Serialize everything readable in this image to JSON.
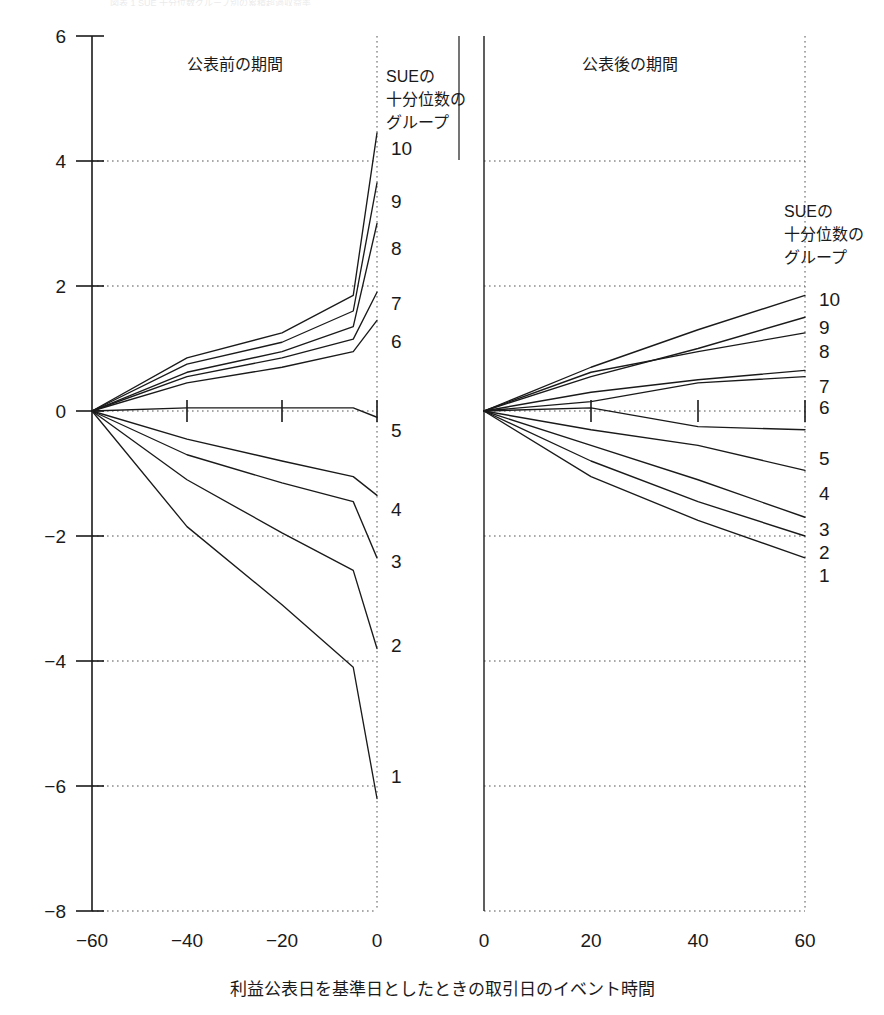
{
  "figure": {
    "faint_top_text": "図表 1 SUE 十分位数グループ別の累積超過収益率",
    "xlabel": "利益公表日を基準日としたときの取引日のイベント時間"
  },
  "panels": {
    "left": {
      "title": "公表前の期間",
      "legend_title_lines": [
        "SUEの",
        "十分位数の",
        "グループ"
      ],
      "x_ticks": [
        "-60",
        "-40",
        "-20",
        "0"
      ],
      "xlim": [
        -60,
        0
      ]
    },
    "right": {
      "title": "公表後の期間",
      "legend_title_lines": [
        "SUEの",
        "十分位数の",
        "グループ"
      ],
      "x_ticks": [
        "0",
        "20",
        "40",
        "60"
      ],
      "xlim": [
        0,
        60
      ]
    }
  },
  "axis": {
    "y_ticks": [
      "6",
      "4",
      "2",
      "0",
      "-2",
      "-4",
      "-6",
      "-8"
    ],
    "ylim": [
      -8,
      6
    ],
    "gridlines_on": true
  },
  "colors": {
    "line": "#1a1a1a",
    "grid": "#555555",
    "background": "#ffffff"
  },
  "chart_data": {
    "type": "line",
    "title": "",
    "subtitle": "",
    "xlabel": "利益公表日を基準日としたときの取引日のイベント時間",
    "ylabel": "",
    "ylim": [
      -8,
      6
    ],
    "grid": true,
    "legend_position": "right-of-each-panel",
    "legend_title": "SUEの十分位数のグループ",
    "panels": [
      {
        "name": "公表前の期間",
        "xlim": [
          -60,
          0
        ],
        "x": [
          -60,
          -40,
          -20,
          -5,
          0
        ],
        "series": [
          {
            "name": "10",
            "values": [
              0.0,
              0.85,
              1.25,
              1.85,
              4.45
            ]
          },
          {
            "name": "9",
            "values": [
              0.0,
              0.75,
              1.1,
              1.6,
              3.65
            ]
          },
          {
            "name": "8",
            "values": [
              0.0,
              0.62,
              0.95,
              1.35,
              3.0
            ]
          },
          {
            "name": "7",
            "values": [
              0.0,
              0.55,
              0.85,
              1.15,
              1.9
            ]
          },
          {
            "name": "6",
            "values": [
              0.0,
              0.45,
              0.7,
              0.95,
              1.45
            ]
          },
          {
            "name": "5",
            "values": [
              0.0,
              0.05,
              0.05,
              0.05,
              -0.1
            ]
          },
          {
            "name": "4",
            "values": [
              0.0,
              -0.45,
              -0.8,
              -1.05,
              -1.35
            ]
          },
          {
            "name": "3",
            "values": [
              0.0,
              -0.7,
              -1.15,
              -1.45,
              -2.35
            ]
          },
          {
            "name": "2",
            "values": [
              0.0,
              -1.1,
              -1.95,
              -2.55,
              -3.8
            ]
          },
          {
            "name": "1",
            "values": [
              0.0,
              -1.85,
              -3.1,
              -4.1,
              -6.2
            ]
          }
        ]
      },
      {
        "name": "公表後の期間",
        "xlim": [
          0,
          60
        ],
        "x": [
          0,
          20,
          40,
          60
        ],
        "series": [
          {
            "name": "10",
            "values": [
              0.0,
              0.7,
              1.3,
              1.85
            ]
          },
          {
            "name": "9",
            "values": [
              0.0,
              0.55,
              1.0,
              1.5
            ]
          },
          {
            "name": "8",
            "values": [
              0.0,
              0.62,
              0.95,
              1.25
            ]
          },
          {
            "name": "7",
            "values": [
              0.0,
              0.3,
              0.5,
              0.65
            ]
          },
          {
            "name": "6",
            "values": [
              0.0,
              0.15,
              0.45,
              0.55
            ]
          },
          {
            "name": "5",
            "values": [
              0.0,
              0.05,
              -0.25,
              -0.3
            ]
          },
          {
            "name": "4",
            "values": [
              0.0,
              -0.3,
              -0.55,
              -0.95
            ]
          },
          {
            "name": "3",
            "values": [
              0.0,
              -0.55,
              -1.1,
              -1.7
            ]
          },
          {
            "name": "2",
            "values": [
              0.0,
              -0.8,
              -1.45,
              -2.0
            ]
          },
          {
            "name": "1",
            "values": [
              0.0,
              -1.05,
              -1.75,
              -2.35
            ]
          }
        ]
      }
    ]
  },
  "labels": {
    "left_series_labels": [
      "10",
      "9",
      "8",
      "7",
      "6",
      "5",
      "4",
      "3",
      "2",
      "1"
    ],
    "right_series_labels": [
      "10",
      "9",
      "8",
      "7",
      "6",
      "5",
      "4",
      "3",
      "2",
      "1"
    ]
  }
}
